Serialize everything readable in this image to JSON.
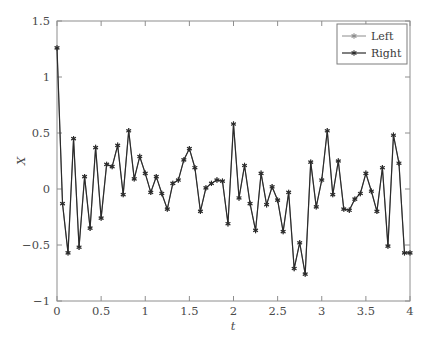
{
  "chart_data": {
    "type": "line",
    "title": "",
    "xlabel": "t",
    "ylabel": "X",
    "xlim": [
      0,
      4
    ],
    "ylim": [
      -1,
      1.5
    ],
    "grid": false,
    "legend_position": "top-right",
    "xticks": [
      0,
      0.5,
      1,
      1.5,
      2,
      2.5,
      3,
      3.5,
      4
    ],
    "xtick_labels": [
      "0",
      "0.5",
      "1",
      "1.5",
      "2",
      "2.5",
      "3",
      "3.5",
      "4"
    ],
    "yticks": [
      -1,
      -0.5,
      0,
      0.5,
      1,
      1.5
    ],
    "ytick_labels": [
      "−1",
      "−0.5",
      "0",
      "0.5",
      "1",
      "1.5"
    ],
    "marker": "six-pointed-star",
    "x": [
      0,
      0.0625,
      0.125,
      0.1875,
      0.25,
      0.3125,
      0.375,
      0.4375,
      0.5,
      0.5625,
      0.625,
      0.6875,
      0.75,
      0.8125,
      0.875,
      0.9375,
      1,
      1.0625,
      1.125,
      1.1875,
      1.25,
      1.3125,
      1.375,
      1.4375,
      1.5,
      1.5625,
      1.625,
      1.6875,
      1.75,
      1.8125,
      1.875,
      1.9375,
      2,
      2.0625,
      2.125,
      2.1875,
      2.25,
      2.3125,
      2.375,
      2.4375,
      2.5,
      2.5625,
      2.625,
      2.6875,
      2.75,
      2.8125,
      2.875,
      2.9375,
      3,
      3.0625,
      3.125,
      3.1875,
      3.25,
      3.3125,
      3.375,
      3.4375,
      3.5,
      3.5625,
      3.625,
      3.6875,
      3.75,
      3.8125,
      3.875,
      3.9375,
      4
    ],
    "series": [
      {
        "name": "Left",
        "color": "#8c8c8c",
        "line_width": 1.0,
        "values": [
          1.26,
          -0.13,
          -0.57,
          0.45,
          -0.52,
          0.11,
          -0.35,
          0.37,
          -0.26,
          0.22,
          0.2,
          0.39,
          -0.05,
          0.52,
          0.09,
          0.29,
          0.14,
          -0.03,
          0.11,
          -0.04,
          -0.18,
          0.05,
          0.08,
          0.26,
          0.36,
          0.19,
          -0.2,
          0.01,
          0.05,
          0.08,
          0.07,
          -0.31,
          0.58,
          -0.08,
          0.21,
          -0.13,
          -0.37,
          0.14,
          -0.14,
          0.02,
          -0.1,
          -0.38,
          -0.03,
          -0.71,
          -0.48,
          -0.76,
          0.24,
          -0.16,
          0.08,
          0.52,
          -0.05,
          0.25,
          -0.18,
          -0.19,
          -0.09,
          -0.04,
          0.14,
          -0.02,
          -0.2,
          0.19,
          -0.51,
          0.48,
          0.23,
          -0.57,
          -0.57
        ]
      },
      {
        "name": "Right",
        "color": "#2b2b2b",
        "line_width": 1.2,
        "values": [
          1.26,
          -0.13,
          -0.57,
          0.45,
          -0.52,
          0.11,
          -0.35,
          0.37,
          -0.26,
          0.22,
          0.2,
          0.39,
          -0.05,
          0.52,
          0.09,
          0.29,
          0.14,
          -0.03,
          0.11,
          -0.04,
          -0.18,
          0.05,
          0.08,
          0.26,
          0.36,
          0.19,
          -0.2,
          0.01,
          0.05,
          0.08,
          0.07,
          -0.31,
          0.58,
          -0.08,
          0.21,
          -0.13,
          -0.37,
          0.14,
          -0.14,
          0.02,
          -0.1,
          -0.38,
          -0.03,
          -0.71,
          -0.48,
          -0.76,
          0.24,
          -0.16,
          0.08,
          0.52,
          -0.05,
          0.25,
          -0.18,
          -0.19,
          -0.09,
          -0.04,
          0.14,
          -0.02,
          -0.2,
          0.19,
          -0.51,
          0.48,
          0.23,
          -0.57,
          -0.57
        ]
      }
    ]
  },
  "legend": {
    "entries": [
      {
        "label": "Left"
      },
      {
        "label": "Right"
      }
    ]
  },
  "axes": {
    "x_title": "t",
    "y_title": "X"
  }
}
